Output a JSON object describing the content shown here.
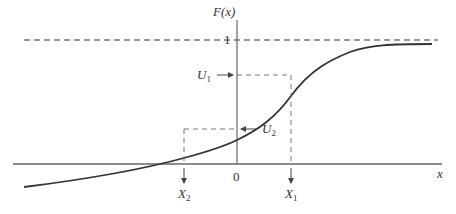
{
  "figure": {
    "y_axis_label": "F(x)",
    "x_axis_label": "x",
    "one_label": "1",
    "origin_label": "0",
    "u1_label": "U",
    "u1_sub": "1",
    "u2_label": "U",
    "u2_sub": "2",
    "x1_label": "X",
    "x1_sub": "1",
    "x2_label": "X",
    "x2_sub": "2"
  },
  "colors": {
    "curve": "#333333",
    "axes": "#555555",
    "dashed": "#777777"
  }
}
